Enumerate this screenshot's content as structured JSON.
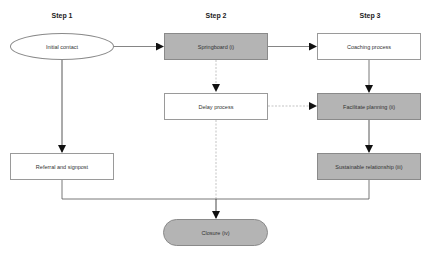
{
  "diagram": {
    "steps": [
      {
        "label": "Step 1"
      },
      {
        "label": "Step 2"
      },
      {
        "label": "Step 3"
      }
    ],
    "nodes": {
      "initial_contact": {
        "label": "Initial contact",
        "shape": "ellipse",
        "fill": "#ffffff"
      },
      "springboard": {
        "label": "Springboard (i)",
        "shape": "rectangle",
        "fill": "#b4b4b4"
      },
      "coaching_process": {
        "label": "Coaching process",
        "shape": "rectangle",
        "fill": "#ffffff"
      },
      "delay_process": {
        "label": "Delay process",
        "shape": "rectangle",
        "fill": "#ffffff"
      },
      "facilitate_planning": {
        "label": "Facilitate planning (ii)",
        "shape": "rectangle",
        "fill": "#b4b4b4"
      },
      "referral_signpost": {
        "label": "Referral and signpost",
        "shape": "rectangle",
        "fill": "#ffffff"
      },
      "sustainable_relationship": {
        "label": "Sustainable relationship (iii)",
        "shape": "rectangle",
        "fill": "#b4b4b4"
      },
      "closure": {
        "label": "Closure (iv)",
        "shape": "rounded",
        "fill": "#b4b4b4"
      }
    },
    "edges": [
      {
        "from": "initial_contact",
        "to": "springboard",
        "style": "solid"
      },
      {
        "from": "springboard",
        "to": "coaching_process",
        "style": "solid"
      },
      {
        "from": "initial_contact",
        "to": "referral_signpost",
        "style": "solid"
      },
      {
        "from": "springboard",
        "to": "delay_process",
        "style": "dashed"
      },
      {
        "from": "delay_process",
        "to": "facilitate_planning",
        "style": "dashed"
      },
      {
        "from": "coaching_process",
        "to": "facilitate_planning",
        "style": "solid"
      },
      {
        "from": "facilitate_planning",
        "to": "sustainable_relationship",
        "style": "solid"
      },
      {
        "from": "delay_process",
        "to": "closure",
        "style": "dashed"
      },
      {
        "from": "referral_signpost",
        "to": "closure",
        "style": "solid"
      },
      {
        "from": "sustainable_relationship",
        "to": "closure",
        "style": "solid"
      }
    ],
    "colors": {
      "gray_fill": "#b4b4b4",
      "line": "#555555",
      "dashed_line": "#aaaaaa"
    }
  }
}
